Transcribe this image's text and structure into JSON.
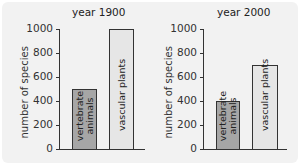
{
  "chart_data": [
    {
      "type": "bar",
      "title": "year 1900",
      "xlabel": "",
      "ylabel": "number of species",
      "categories": [
        "vertebrate animals",
        "vascular plants"
      ],
      "values": [
        500,
        1000
      ],
      "ylim": [
        0,
        1000
      ],
      "yticks": [
        "0",
        "200",
        "400",
        "600",
        "800",
        "1000"
      ],
      "bar_colors": [
        "#a6a6a6",
        "#e6e6e6"
      ],
      "grid": false,
      "legend": "none"
    },
    {
      "type": "bar",
      "title": "year 2000",
      "xlabel": "",
      "ylabel": "number of species",
      "categories": [
        "vertebrate animals",
        "vascular plants"
      ],
      "values": [
        400,
        700
      ],
      "ylim": [
        0,
        1000
      ],
      "yticks": [
        "0",
        "200",
        "400",
        "600",
        "800",
        "1000"
      ],
      "bar_colors": [
        "#a6a6a6",
        "#e6e6e6"
      ],
      "grid": false,
      "legend": "none"
    }
  ],
  "labels": {
    "vertebrate_line1": "vertebrate",
    "vertebrate_line2": "animals",
    "vascular": "vascular plants"
  }
}
